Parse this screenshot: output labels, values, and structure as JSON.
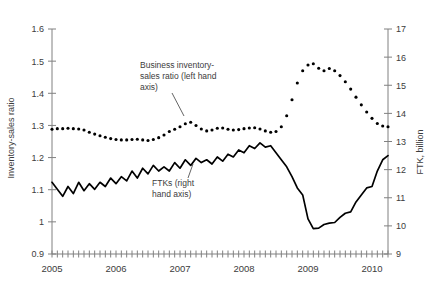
{
  "chart_data": {
    "type": "line",
    "title": "",
    "xlabel": "",
    "ylabel": "Inventory-sales ratio",
    "y2label": "FTK, billion",
    "xlim": [
      2005.0,
      2010.25
    ],
    "ylim": [
      0.9,
      1.6
    ],
    "y2lim": [
      9,
      17
    ],
    "yticks": [
      "1.6",
      "1.5",
      "1.4",
      "1.3",
      "1.2",
      "1.1",
      "1",
      "0.9"
    ],
    "ytick_values": [
      1.6,
      1.5,
      1.4,
      1.3,
      1.2,
      1.1,
      1.0,
      0.9
    ],
    "y2ticks": [
      "17",
      "16",
      "15",
      "14",
      "13",
      "12",
      "11",
      "10",
      "9"
    ],
    "y2tick_values": [
      17,
      16,
      15,
      14,
      13,
      12,
      11,
      10,
      9
    ],
    "xticks": [
      "2005",
      "2006",
      "2007",
      "2008",
      "2009",
      "2010"
    ],
    "xtick_values": [
      2005,
      2006,
      2007,
      2008,
      2009,
      2010
    ],
    "xtick_minor_interval_months": 1,
    "grid": false,
    "legend": "none",
    "annotations": [
      {
        "name": "inventory-annotation",
        "text_lines": [
          "Business inventory-",
          "sales ratio (left hand",
          "axis)"
        ],
        "text_x": 140,
        "text_y": 68,
        "leader_from": [
          172,
          93
        ],
        "leader_to": [
          184,
          116
        ]
      },
      {
        "name": "ftk-annotation",
        "text_lines": [
          "FTKs (right",
          "hand axis)"
        ],
        "text_x": 152,
        "text_y": 186,
        "leader_from": [
          188,
          178
        ],
        "leader_to": [
          193,
          164
        ]
      }
    ],
    "series": [
      {
        "name": "Business inventory-sales ratio (left hand axis)",
        "axis": "left",
        "style": "dotted-markers",
        "color": "#000000",
        "x": [
          2005.0,
          2005.083,
          2005.167,
          2005.25,
          2005.333,
          2005.417,
          2005.5,
          2005.583,
          2005.667,
          2005.75,
          2005.833,
          2005.917,
          2006.0,
          2006.083,
          2006.167,
          2006.25,
          2006.333,
          2006.417,
          2006.5,
          2006.583,
          2006.667,
          2006.75,
          2006.833,
          2006.917,
          2007.0,
          2007.083,
          2007.167,
          2007.25,
          2007.333,
          2007.417,
          2007.5,
          2007.583,
          2007.667,
          2007.75,
          2007.833,
          2007.917,
          2008.0,
          2008.083,
          2008.167,
          2008.25,
          2008.333,
          2008.417,
          2008.5,
          2008.583,
          2008.667,
          2008.75,
          2008.833,
          2008.917,
          2009.0,
          2009.083,
          2009.167,
          2009.25,
          2009.333,
          2009.417,
          2009.5,
          2009.583,
          2009.667,
          2009.75,
          2009.833,
          2009.917,
          2010.0,
          2010.083,
          2010.167,
          2010.25
        ],
        "values": [
          1.288,
          1.29,
          1.29,
          1.291,
          1.29,
          1.289,
          1.286,
          1.279,
          1.273,
          1.268,
          1.263,
          1.259,
          1.256,
          1.255,
          1.255,
          1.256,
          1.257,
          1.255,
          1.253,
          1.256,
          1.262,
          1.27,
          1.281,
          1.288,
          1.296,
          1.305,
          1.31,
          1.3,
          1.289,
          1.283,
          1.286,
          1.291,
          1.292,
          1.288,
          1.286,
          1.287,
          1.29,
          1.292,
          1.293,
          1.289,
          1.283,
          1.279,
          1.281,
          1.296,
          1.33,
          1.38,
          1.432,
          1.47,
          1.488,
          1.492,
          1.478,
          1.47,
          1.477,
          1.47,
          1.455,
          1.436,
          1.413,
          1.388,
          1.364,
          1.342,
          1.322,
          1.306,
          1.298,
          1.296
        ]
      },
      {
        "name": "FTKs (right hand axis)",
        "axis": "right",
        "style": "solid-line",
        "color": "#000000",
        "x": [
          2005.0,
          2005.083,
          2005.167,
          2005.25,
          2005.333,
          2005.417,
          2005.5,
          2005.583,
          2005.667,
          2005.75,
          2005.833,
          2005.917,
          2006.0,
          2006.083,
          2006.167,
          2006.25,
          2006.333,
          2006.417,
          2006.5,
          2006.583,
          2006.667,
          2006.75,
          2006.833,
          2006.917,
          2007.0,
          2007.083,
          2007.167,
          2007.25,
          2007.333,
          2007.417,
          2007.5,
          2007.583,
          2007.667,
          2007.75,
          2007.833,
          2007.917,
          2008.0,
          2008.083,
          2008.167,
          2008.25,
          2008.333,
          2008.417,
          2008.5,
          2008.583,
          2008.667,
          2008.75,
          2008.833,
          2008.917,
          2009.0,
          2009.083,
          2009.167,
          2009.25,
          2009.333,
          2009.417,
          2009.5,
          2009.583,
          2009.667,
          2009.75,
          2009.833,
          2009.917,
          2010.0,
          2010.083,
          2010.167,
          2010.25
        ],
        "values": [
          11.55,
          11.3,
          11.05,
          11.4,
          11.15,
          11.55,
          11.25,
          11.5,
          11.3,
          11.55,
          11.4,
          11.7,
          11.5,
          11.75,
          11.6,
          11.95,
          11.7,
          12.05,
          11.85,
          12.15,
          11.95,
          12.1,
          11.95,
          12.25,
          12.05,
          12.35,
          12.15,
          12.4,
          12.25,
          12.35,
          12.2,
          12.45,
          12.3,
          12.55,
          12.45,
          12.7,
          12.6,
          12.85,
          12.75,
          12.95,
          12.8,
          12.85,
          12.6,
          12.35,
          12.1,
          11.75,
          11.35,
          11.1,
          10.25,
          9.9,
          9.92,
          10.05,
          10.1,
          10.12,
          10.3,
          10.45,
          10.5,
          10.85,
          11.1,
          11.35,
          11.4,
          11.95,
          12.35,
          12.5
        ]
      }
    ]
  },
  "axes": {
    "left_title": "Inventory-sales ratio",
    "right_title": "FTK, billion"
  }
}
